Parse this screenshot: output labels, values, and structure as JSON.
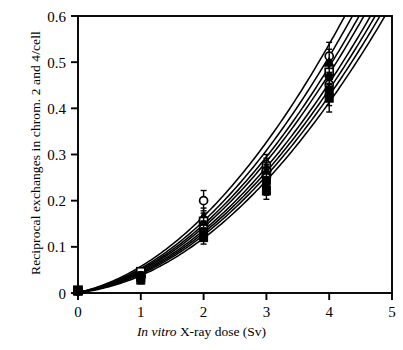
{
  "figure": {
    "background_color": "#ffffff",
    "ink_color": "#000000"
  },
  "axes": {
    "x_title_italic": "In vitro",
    "x_title_rest": "  X-ray dose (Sv)",
    "x_title_full": "In vitro  X-ray dose (Sv)",
    "y_title": "Reciprocal exchanges in chrom. 2 and 4/cell",
    "x_ticks": [
      "0",
      "1",
      "2",
      "3",
      "4",
      "5"
    ],
    "y_ticks": [
      "0",
      "0.1",
      "0.2",
      "0.3",
      "0.4",
      "0.5",
      "0.6"
    ]
  },
  "chart_data": {
    "type": "scatter",
    "title": "",
    "subtitle": "",
    "xlabel": "In vitro  X-ray dose (Sv)",
    "ylabel": "Reciprocal exchanges in chrom. 2 and 4/cell",
    "xlim": [
      0,
      5
    ],
    "ylim": [
      0,
      0.6
    ],
    "xticks": [
      0,
      1,
      2,
      3,
      4,
      5
    ],
    "yticks": [
      0,
      0.1,
      0.2,
      0.3,
      0.4,
      0.5,
      0.6
    ],
    "grid": false,
    "legend": "none",
    "frame": "full-box",
    "x": [
      0,
      1,
      2,
      3,
      4
    ],
    "series": [
      {
        "name": "donor-1",
        "marker": "open-circle",
        "values": [
          0.005,
          0.045,
          0.2,
          0.278,
          0.513
        ],
        "errors": [
          0.004,
          0.008,
          0.022,
          0.022,
          0.03
        ],
        "curve": {
          "alpha": 0.0305,
          "beta": 0.026,
          "c": 0.001
        }
      },
      {
        "name": "donor-2",
        "marker": "filled-triangle",
        "values": [
          0.005,
          0.042,
          0.166,
          0.272,
          0.5
        ],
        "errors": [
          0.004,
          0.008,
          0.018,
          0.02,
          0.028
        ],
        "curve": {
          "alpha": 0.027,
          "beta": 0.0252,
          "c": 0.001
        }
      },
      {
        "name": "donor-3",
        "marker": "open-square",
        "values": [
          0.006,
          0.046,
          0.155,
          0.262,
          0.478
        ],
        "errors": [
          0.004,
          0.008,
          0.018,
          0.02,
          0.026
        ],
        "curve": {
          "alpha": 0.025,
          "beta": 0.0243,
          "c": 0.0012
        }
      },
      {
        "name": "donor-4",
        "marker": "filled-circle",
        "values": [
          0.005,
          0.038,
          0.148,
          0.258,
          0.468
        ],
        "errors": [
          0.004,
          0.008,
          0.016,
          0.02,
          0.026
        ],
        "curve": {
          "alpha": 0.0232,
          "beta": 0.0238,
          "c": 0.001
        }
      },
      {
        "name": "donor-5",
        "marker": "open-circle",
        "values": [
          0.004,
          0.036,
          0.14,
          0.25,
          0.452
        ],
        "errors": [
          0.004,
          0.008,
          0.016,
          0.018,
          0.026
        ],
        "curve": {
          "alpha": 0.0215,
          "beta": 0.023,
          "c": 0.0008
        }
      },
      {
        "name": "donor-6",
        "marker": "filled-square",
        "values": [
          0.005,
          0.034,
          0.132,
          0.244,
          0.44
        ],
        "errors": [
          0.004,
          0.008,
          0.015,
          0.018,
          0.024
        ],
        "curve": {
          "alpha": 0.0196,
          "beta": 0.0226,
          "c": 0.001
        }
      },
      {
        "name": "donor-7",
        "marker": "filled-circle",
        "values": [
          0.005,
          0.031,
          0.127,
          0.23,
          0.43
        ],
        "errors": [
          0.004,
          0.008,
          0.014,
          0.018,
          0.024
        ],
        "curve": {
          "alpha": 0.0178,
          "beta": 0.0222,
          "c": 0.001
        }
      },
      {
        "name": "donor-8",
        "marker": "filled-square",
        "values": [
          0.004,
          0.028,
          0.12,
          0.221,
          0.422
        ],
        "errors": [
          0.004,
          0.008,
          0.014,
          0.018,
          0.03
        ],
        "curve": {
          "alpha": 0.015,
          "beta": 0.022,
          "c": 0.0008
        }
      }
    ]
  }
}
